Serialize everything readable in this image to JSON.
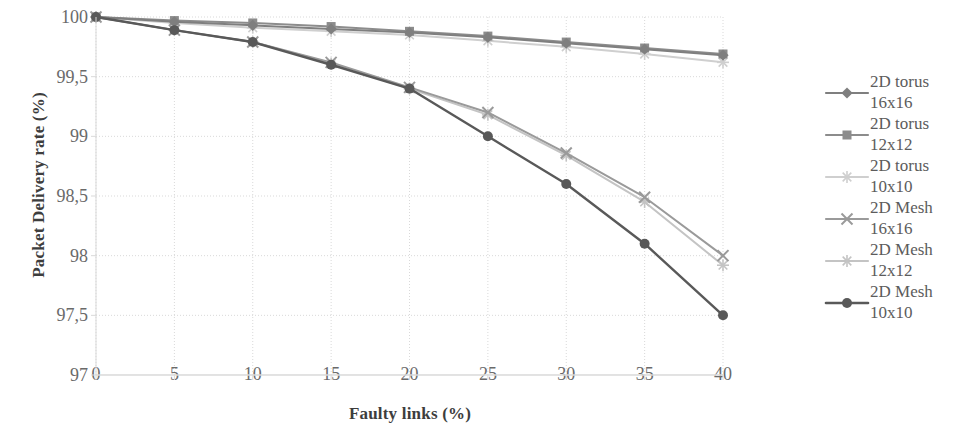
{
  "chart_data": {
    "type": "line",
    "title": "",
    "xlabel": "Faulty links (%)",
    "ylabel": "Packet Delivery rate (%)",
    "xlim": [
      0,
      40
    ],
    "ylim": [
      97,
      100
    ],
    "xticks": [
      "0",
      "5",
      "10",
      "15",
      "20",
      "25",
      "30",
      "35",
      "40"
    ],
    "yticks": [
      "97",
      "97,5",
      "98",
      "98,5",
      "99",
      "99,5",
      "100"
    ],
    "x": [
      0,
      5,
      10,
      15,
      20,
      25,
      30,
      35,
      40
    ],
    "grid": true,
    "legend_position": "right",
    "decimal_separator": ",",
    "series": [
      {
        "name": "2D torus 16x16",
        "label_line1": "2D torus",
        "label_line2": "16x16",
        "marker": "diamond",
        "color": "#7f7f7f",
        "values": [
          100,
          99.96,
          99.93,
          99.9,
          99.87,
          99.83,
          99.78,
          99.73,
          99.68
        ]
      },
      {
        "name": "2D torus 12x12",
        "label_line1": "2D torus",
        "label_line2": "12x12",
        "marker": "square",
        "color": "#8c8c8c",
        "values": [
          100,
          99.97,
          99.95,
          99.92,
          99.88,
          99.84,
          99.79,
          99.74,
          99.69
        ]
      },
      {
        "name": "2D torus 10x10",
        "label_line1": "2D torus",
        "label_line2": "10x10",
        "marker": "star",
        "color": "#cfcfcf",
        "values": [
          100,
          99.95,
          99.91,
          99.88,
          99.85,
          99.8,
          99.75,
          99.69,
          99.62
        ]
      },
      {
        "name": "2D Mesh 16x16",
        "label_line1": "2D Mesh",
        "label_line2": "16x16",
        "marker": "cross",
        "color": "#9a9a9a",
        "values": [
          100,
          99.89,
          99.79,
          99.62,
          99.41,
          99.2,
          98.86,
          98.49,
          98.0
        ]
      },
      {
        "name": "2D Mesh 12x12",
        "label_line1": "2D Mesh",
        "label_line2": "12x12",
        "marker": "asterisk",
        "color": "#c4c4c4",
        "values": [
          100,
          99.89,
          99.79,
          99.61,
          99.4,
          99.18,
          98.84,
          98.45,
          97.92
        ]
      },
      {
        "name": "2D Mesh 10x10",
        "label_line1": "2D Mesh",
        "label_line2": "10x10",
        "marker": "circle",
        "color": "#595959",
        "values": [
          100,
          99.89,
          99.79,
          99.6,
          99.4,
          99.0,
          98.6,
          98.1,
          97.5
        ]
      }
    ]
  },
  "axis": {
    "grid_color": "#d9d9d9",
    "tick_color": "#6a6a6a",
    "title_color": "#3d3d3d"
  }
}
